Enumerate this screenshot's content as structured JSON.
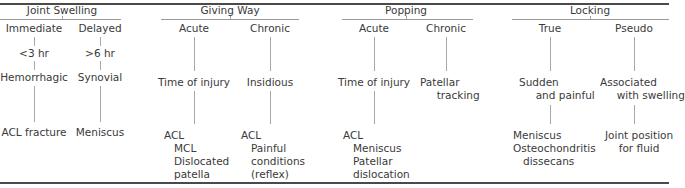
{
  "columns": [
    {
      "heading": "Joint Swelling",
      "branches": [
        {
          "label": "Immediate",
          "steps": [
            "<3 hr",
            "Hemorrhagic",
            "ACL fracture"
          ]
        },
        {
          "label": "Delayed",
          "steps": [
            ">6 hr",
            "Synovial",
            "Meniscus"
          ]
        }
      ]
    },
    {
      "heading": "Giving Way",
      "branches": [
        {
          "label": "Acute",
          "steps": [
            "Time of injury",
            "ACL\n   MCL\n   Dislocated\n   patella"
          ]
        },
        {
          "label": "Chronic",
          "steps": [
            "Insidious",
            "ACL\n   Painful\n   conditions\n   (reflex)"
          ]
        }
      ]
    },
    {
      "heading": "Popping",
      "branches": [
        {
          "label": "Acute",
          "steps": [
            "Time of injury",
            "ACL\n   Meniscus\n   Patellar\n   dislocation"
          ]
        },
        {
          "label": "Chronic",
          "steps": [
            "Patellar\n     tracking"
          ]
        }
      ]
    },
    {
      "heading": "Locking",
      "branches": [
        {
          "label": "True",
          "steps": [
            "Sudden\n     and painful",
            "Meniscus\nOsteochondritis\n   dissecans"
          ]
        },
        {
          "label": "Pseudo",
          "steps": [
            "Associated\n     with swelling",
            "Joint position\nfor fluid"
          ]
        }
      ]
    }
  ]
}
